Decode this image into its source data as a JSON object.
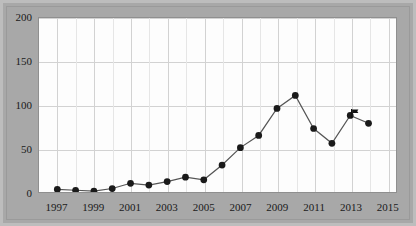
{
  "chart_data": {
    "type": "line",
    "title": "",
    "subtitle": "",
    "xlabel": "",
    "ylabel": "",
    "xlim": [
      1996,
      2015.5
    ],
    "ylim": [
      0,
      200
    ],
    "yticks": [
      0,
      50,
      100,
      150,
      200
    ],
    "xticks": [
      1997,
      1999,
      2001,
      2003,
      2005,
      2007,
      2009,
      2011,
      2013,
      2015
    ],
    "grid": true,
    "legend": "none",
    "marker": "filled-circle",
    "line_color": "#555555",
    "marker_color": "#1a1a1a",
    "x": [
      1997,
      1998,
      1999,
      2000,
      2001,
      2002,
      2003,
      2004,
      2005,
      2006,
      2007,
      2008,
      2009,
      2010,
      2011,
      2012,
      2013,
      2014
    ],
    "values": [
      3,
      2,
      1,
      4,
      10,
      8,
      12,
      17,
      14,
      31,
      51,
      65,
      96,
      111,
      73,
      56,
      88,
      79
    ],
    "series": [
      {
        "name": "series-1",
        "values": [
          3,
          2,
          1,
          4,
          10,
          8,
          12,
          17,
          14,
          31,
          51,
          65,
          96,
          111,
          73,
          56,
          88,
          79
        ]
      }
    ],
    "annotations": [
      {
        "name": "flag-marker",
        "x": 2013,
        "y": 88,
        "symbol": "flag",
        "color": "#111111"
      }
    ]
  },
  "axis": {
    "y_tick_labels": [
      "0",
      "50",
      "100",
      "150",
      "200"
    ],
    "x_tick_labels": [
      "1997",
      "1999",
      "2001",
      "2003",
      "2005",
      "2007",
      "2009",
      "2011",
      "2013",
      "2015"
    ]
  },
  "colors": {
    "frame": "#a8a8a8",
    "plot_background": "#fdfdfd",
    "gridline": "#d2d2d2",
    "line": "#555555",
    "marker": "#1a1a1a",
    "text": "#1a1a1a"
  }
}
